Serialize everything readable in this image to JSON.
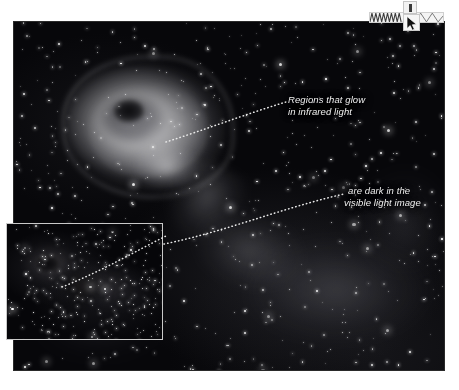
{
  "figure": {
    "alt_description": "Infrared image of an emission nebula with a bright glowing head and dark elephant-trunk pillars, annotated with two dotted leader lines, plus a visible-light inset image in the lower left corner",
    "main_image_name": "infrared-nebula-image",
    "inset_image_name": "visible-light-inset-image"
  },
  "annotations": [
    {
      "id": "ir-glow",
      "line1": "Regions that glow",
      "line2": "in infrared light"
    },
    {
      "id": "visible-dark",
      "line1": "are dark in the",
      "line2": "visible light image"
    }
  ],
  "overlay": {
    "toolbar_name": "waveform-toolbar-strip",
    "tooltip_name": "tooltip-badge",
    "cursor_name": "mouse-cursor-arrow"
  },
  "colors": {
    "page_background": "#ffffff",
    "image_background": "#07070a",
    "caption_text": "#f0f0f0",
    "leader_line": "#e9e9e9",
    "inset_border": "#c9c9c9",
    "toolbar_background": "#f4f4f4"
  }
}
